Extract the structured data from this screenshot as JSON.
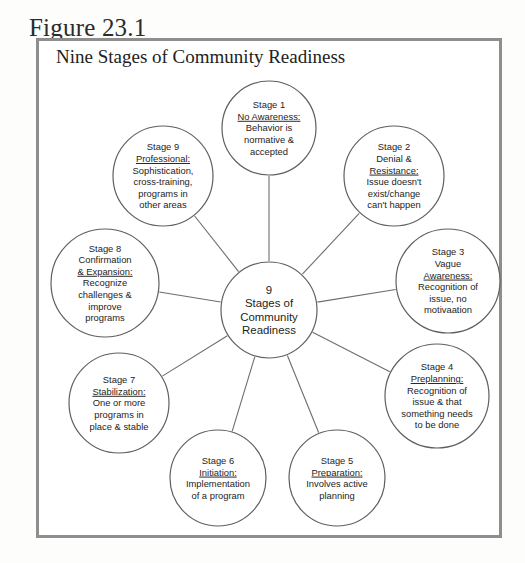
{
  "figure": {
    "label": "Figure 23.1",
    "title": "Nine Stages of Community Readiness"
  },
  "hub": {
    "lines": [
      "9",
      "Stages of",
      "Community",
      "Readiness"
    ]
  },
  "colors": {
    "box_border": "#8e8e8e",
    "circle_stroke": "#5f5f5f",
    "spoke_stroke": "#6d6d6d",
    "text": "#1d1d1d",
    "page_background": "#fdfdfc"
  },
  "chart_data": {
    "type": "diagram",
    "title": "Nine Stages of Community Readiness",
    "layout": "radial hub-and-spoke, nine nodes around a central hub",
    "center": {
      "cx": 269,
      "cy": 310,
      "r": 48,
      "label": "9 Stages of Community Readiness"
    },
    "nodes": [
      {
        "stage": "Stage 1",
        "name": "No Awareness:",
        "name_underlined": true,
        "description": [
          "Behavior is",
          "normative &",
          "accepted"
        ],
        "lines": [
          "Stage 1",
          "No Awareness:",
          "Behavior is",
          "normative &",
          "accepted"
        ],
        "underline_line_index": 1,
        "cx": 269,
        "cy": 128,
        "r": 47,
        "angle_deg": 270
      },
      {
        "stage": "Stage 2",
        "name": "Denial & Resistance:",
        "name_underlined": true,
        "description": [
          "Issue doesn't",
          "exist/change",
          "can't happen"
        ],
        "lines": [
          "Stage 2",
          "Denial &",
          "Resistance:",
          "Issue doesn't",
          "exist/change",
          "can't happen"
        ],
        "underline_line_index": 2,
        "cx": 394,
        "cy": 176,
        "r": 50,
        "angle_deg": 315
      },
      {
        "stage": "Stage 3",
        "name": "Vague Awareness:",
        "name_underlined": true,
        "description": [
          "Recognition of",
          "issue, no",
          "motivaation"
        ],
        "lines": [
          "Stage 3",
          "Vague",
          "Awareness:",
          "Recognition of",
          "issue, no",
          "motivaation"
        ],
        "underline_line_index": 2,
        "cx": 448,
        "cy": 281,
        "r": 52,
        "angle_deg": 0
      },
      {
        "stage": "Stage 4",
        "name": "Preplanning:",
        "name_underlined": true,
        "description": [
          "Recognition of",
          "issue & that",
          "something needs",
          "to be done"
        ],
        "lines": [
          "Stage 4",
          "Preplanning:",
          "Recognition of",
          "issue & that",
          "something needs",
          "to be done"
        ],
        "underline_line_index": 1,
        "cx": 437,
        "cy": 396,
        "r": 52,
        "angle_deg": 45
      },
      {
        "stage": "Stage 5",
        "name": "Preparation:",
        "name_underlined": true,
        "description": [
          "Involves active",
          "planning"
        ],
        "lines": [
          "Stage 5",
          "Preparation:",
          "Involves active",
          "planning"
        ],
        "underline_line_index": 1,
        "cx": 337,
        "cy": 478,
        "r": 48,
        "angle_deg": 70
      },
      {
        "stage": "Stage 6",
        "name": "Initiation:",
        "name_underlined": true,
        "description": [
          "Implementation",
          "of a program"
        ],
        "lines": [
          "Stage 6",
          "Initiation:",
          "Implementation",
          "of a program"
        ],
        "underline_line_index": 1,
        "cx": 218,
        "cy": 478,
        "r": 48,
        "angle_deg": 110
      },
      {
        "stage": "Stage 7",
        "name": "Stabilization:",
        "name_underlined": true,
        "description": [
          "One or more",
          "programs in",
          "place & stable"
        ],
        "lines": [
          "Stage 7",
          "Stabilization:",
          "One or more",
          "programs in",
          "place & stable"
        ],
        "underline_line_index": 1,
        "cx": 119,
        "cy": 403,
        "r": 50,
        "angle_deg": 135
      },
      {
        "stage": "Stage 8",
        "name": "Confirmation & Expansion:",
        "name_underlined": true,
        "description": [
          "Recognize",
          "challenges &",
          "improve",
          "programs"
        ],
        "lines": [
          "Stage 8",
          "Confirmation",
          "& Expansion:",
          "Recognize",
          "challenges &",
          "improve",
          "programs"
        ],
        "underline_line_index": 2,
        "cx": 105,
        "cy": 283,
        "r": 54,
        "angle_deg": 180
      },
      {
        "stage": "Stage 9",
        "name": "Professional:",
        "name_underlined": true,
        "description": [
          "Sophistication,",
          "cross-training,",
          "programs in",
          "other areas"
        ],
        "lines": [
          "Stage 9",
          "Professional:",
          "Sophistication,",
          "cross-training,",
          "programs in",
          "other areas"
        ],
        "underline_line_index": 1,
        "cx": 163,
        "cy": 176,
        "r": 50,
        "angle_deg": 225
      }
    ]
  }
}
